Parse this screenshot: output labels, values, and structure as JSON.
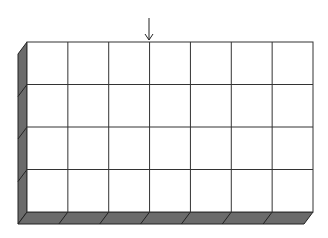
{
  "diagram": {
    "type": "3d-grid-box",
    "columns": 7,
    "rows": 4,
    "front_face": {
      "x": 27,
      "y": 42,
      "width": 286,
      "height": 170
    },
    "depth": {
      "dx": -9,
      "dy": 12
    },
    "arrow": {
      "x": 149,
      "y_start": 18,
      "y_end": 40,
      "points_to_column_line": 3
    },
    "colors": {
      "cell_fill": "#ffffff",
      "grid_line": "#333333",
      "side_fill": "#6b6b6b",
      "edge": "#222222"
    }
  }
}
